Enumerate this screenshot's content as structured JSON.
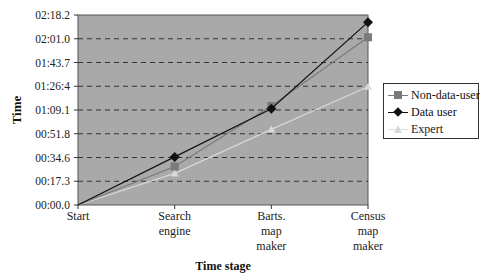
{
  "chart_data": {
    "type": "line",
    "title": "",
    "xlabel": "Time stage",
    "ylabel": "Time",
    "categories": [
      "Start",
      "Search engine",
      "Barts. map maker",
      "Census map maker"
    ],
    "category_lines": [
      [
        "Start"
      ],
      [
        "Search",
        "engine"
      ],
      [
        "Barts.",
        "map",
        "maker"
      ],
      [
        "Census",
        "map",
        "maker"
      ]
    ],
    "y_ticks": [
      "00:00.0",
      "00:17.3",
      "00:34.6",
      "00:51.8",
      "01:09.1",
      "01:26:4",
      "01:43.7",
      "02:01.0",
      "02:18.2"
    ],
    "ylim_seconds": [
      0,
      138.2
    ],
    "grid": "horizontal dashed",
    "legend_position": "right",
    "series": [
      {
        "name": "Non-data-user",
        "marker": "square",
        "color": "#7a7a7a",
        "values_seconds": [
          0,
          28,
          72,
          122
        ]
      },
      {
        "name": "Data user",
        "marker": "diamond",
        "color": "#111111",
        "values_seconds": [
          0,
          35,
          70,
          133
        ]
      },
      {
        "name": "Expert",
        "marker": "triangle",
        "color": "#d8d8d8",
        "values_seconds": [
          0,
          23,
          55,
          86
        ]
      }
    ]
  }
}
